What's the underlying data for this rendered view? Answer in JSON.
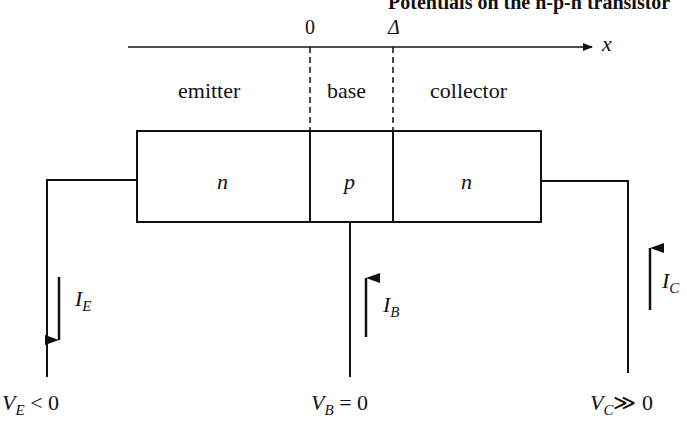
{
  "title": "Potentials on the n-p-n transistor",
  "axis": {
    "label": "x",
    "ticks": [
      "0",
      "Δ"
    ]
  },
  "regions": [
    {
      "name": "emitter",
      "doping": "n"
    },
    {
      "name": "base",
      "doping": "p"
    },
    {
      "name": "collector",
      "doping": "n"
    }
  ],
  "currents": [
    {
      "symbol": "I",
      "sub": "E",
      "direction": "down"
    },
    {
      "symbol": "I",
      "sub": "B",
      "direction": "up"
    },
    {
      "symbol": "I",
      "sub": "C",
      "direction": "up"
    }
  ],
  "voltages": [
    {
      "symbol": "V",
      "sub": "E",
      "relation": "< 0"
    },
    {
      "symbol": "V",
      "sub": "B",
      "relation": "= 0"
    },
    {
      "symbol": "V",
      "sub": "C",
      "relation": "≫ 0"
    }
  ],
  "colors": {
    "ink": "#111111",
    "background": "#ffffff"
  }
}
